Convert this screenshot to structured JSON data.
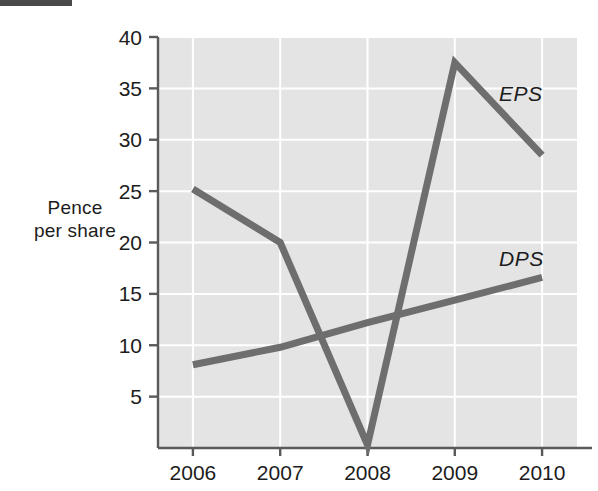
{
  "chart_data": {
    "type": "line",
    "title": "",
    "subtitle": "",
    "xlabel": "",
    "ylabel": "Pence\nper share",
    "ylabel_lines": [
      "Pence",
      "per share"
    ],
    "categories": [
      "2006",
      "2007",
      "2008",
      "2009",
      "2010"
    ],
    "x": [
      2006,
      2007,
      2008,
      2009,
      2010
    ],
    "series": [
      {
        "name": "EPS",
        "values": [
          25.2,
          20.0,
          0.3,
          37.5,
          28.5
        ],
        "color": "#6e6e6e",
        "label": "EPS"
      },
      {
        "name": "DPS",
        "values": [
          8.1,
          9.8,
          12.2,
          14.4,
          16.6
        ],
        "color": "#6e6e6e",
        "label": "DPS"
      }
    ],
    "ylim": [
      0,
      40
    ],
    "xlim": [
      2005.6,
      2010.4
    ],
    "y_ticks": [
      5,
      10,
      15,
      20,
      25,
      30,
      35,
      40
    ],
    "y_tick_labels": [
      "5",
      "10",
      "15",
      "20",
      "25",
      "30",
      "35",
      "40"
    ],
    "x_tick_labels": [
      "2006",
      "2007",
      "2008",
      "2009",
      "2010"
    ],
    "grid": true,
    "grid_color": "#ffffff",
    "plot_background": "#e4e4e4",
    "axis_color": "#5a5a5a",
    "legend_position": "inline-right",
    "legend_entries": [
      "EPS",
      "DPS"
    ]
  },
  "annotations": {
    "eps_label": "EPS",
    "dps_label": "DPS"
  }
}
